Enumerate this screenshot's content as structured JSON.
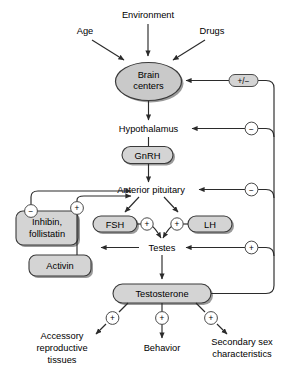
{
  "diagram": {
    "colors": {
      "box_fill": "#d4d4d4",
      "ellipse_fill": "#c9c9c9",
      "stroke": "#2b2b2b",
      "shadow": "#9a9a9a",
      "background": "#ffffff"
    },
    "inputs": [
      {
        "id": "age",
        "label": "Age"
      },
      {
        "id": "environment",
        "label": "Environment"
      },
      {
        "id": "drugs",
        "label": "Drugs"
      }
    ],
    "nodes": [
      {
        "id": "brain_centers",
        "label_line1": "Brain",
        "label_line2": "centers",
        "shape": "ellipse"
      },
      {
        "id": "hypothalamus",
        "label": "Hypothalamus",
        "shape": "text"
      },
      {
        "id": "gnrh",
        "label": "GnRH",
        "shape": "rounded-box"
      },
      {
        "id": "anterior_pituitary",
        "label": "Anterior pituitary",
        "shape": "text"
      },
      {
        "id": "fsh",
        "label": "FSH",
        "shape": "rounded-box"
      },
      {
        "id": "lh",
        "label": "LH",
        "shape": "rounded-box"
      },
      {
        "id": "testes",
        "label": "Testes",
        "shape": "text"
      },
      {
        "id": "testosterone",
        "label": "Testosterone",
        "shape": "rounded-box"
      },
      {
        "id": "inhibin_follistatin",
        "label_line1": "Inhibin,",
        "label_line2": "follistatin",
        "shape": "rounded-box"
      },
      {
        "id": "activin",
        "label": "Activin",
        "shape": "rounded-box"
      }
    ],
    "outputs": [
      {
        "id": "accessory_reproductive_tissues",
        "label_line1": "Accessory",
        "label_line2": "reproductive",
        "label_line3": "tissues"
      },
      {
        "id": "behavior",
        "label": "Behavior"
      },
      {
        "id": "secondary_sex_characteristics",
        "label_line1": "Secondary sex",
        "label_line2": "characteristics"
      }
    ],
    "signs": {
      "plus": "+",
      "minus": "−",
      "plus_minus": "+/−"
    },
    "edges": [
      {
        "id": "age-to-brain",
        "from": "age",
        "to": "brain_centers",
        "sign": ""
      },
      {
        "id": "environment-to-brain",
        "from": "environment",
        "to": "brain_centers",
        "sign": ""
      },
      {
        "id": "drugs-to-brain",
        "from": "drugs",
        "to": "brain_centers",
        "sign": ""
      },
      {
        "id": "brain-to-hypothalamus",
        "from": "brain_centers",
        "to": "hypothalamus",
        "sign": ""
      },
      {
        "id": "hypothalamus-to-gnrh",
        "from": "hypothalamus",
        "to": "gnrh",
        "sign": ""
      },
      {
        "id": "gnrh-to-pituitary",
        "from": "gnrh",
        "to": "anterior_pituitary",
        "sign": ""
      },
      {
        "id": "pituitary-to-fsh",
        "from": "anterior_pituitary",
        "to": "fsh",
        "sign": ""
      },
      {
        "id": "pituitary-to-lh",
        "from": "anterior_pituitary",
        "to": "lh",
        "sign": ""
      },
      {
        "id": "fsh-to-testes",
        "from": "fsh",
        "to": "testes",
        "sign": "+"
      },
      {
        "id": "lh-to-testes",
        "from": "lh",
        "to": "testes",
        "sign": "+"
      },
      {
        "id": "testes-to-testosterone",
        "from": "testes",
        "to": "testosterone",
        "sign": ""
      },
      {
        "id": "testes-to-inhibin",
        "from": "testes",
        "to": "inhibin_follistatin",
        "sign": ""
      },
      {
        "id": "inhibin-to-pituitary",
        "from": "inhibin_follistatin",
        "to": "anterior_pituitary",
        "sign": "−"
      },
      {
        "id": "activin-to-pituitary",
        "from": "activin",
        "to": "anterior_pituitary",
        "sign": "+"
      },
      {
        "id": "testosterone-to-brain",
        "from": "testosterone",
        "to": "brain_centers",
        "sign": "+/−"
      },
      {
        "id": "testosterone-to-hypothalamus",
        "from": "testosterone",
        "to": "hypothalamus",
        "sign": "−"
      },
      {
        "id": "testosterone-to-pituitary",
        "from": "testosterone",
        "to": "anterior_pituitary",
        "sign": "−"
      },
      {
        "id": "testosterone-to-testes",
        "from": "testosterone",
        "to": "testes",
        "sign": "+"
      },
      {
        "id": "testosterone-to-accessory",
        "from": "testosterone",
        "to": "accessory_reproductive_tissues",
        "sign": "+"
      },
      {
        "id": "testosterone-to-behavior",
        "from": "testosterone",
        "to": "behavior",
        "sign": "+"
      },
      {
        "id": "testosterone-to-secondary",
        "from": "testosterone",
        "to": "secondary_sex_characteristics",
        "sign": "+"
      }
    ]
  }
}
